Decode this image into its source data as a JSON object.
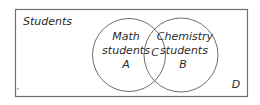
{
  "diagram": {
    "type": "venn",
    "universe": {
      "label": "Students",
      "region_label": "D"
    },
    "sets": [
      {
        "id": "A",
        "line1": "Math",
        "line2": "students",
        "region_label": "A"
      },
      {
        "id": "B",
        "line1": "Chemistry",
        "line2": "students",
        "region_label": "B"
      }
    ],
    "intersection": {
      "region_label": "C"
    },
    "colors": {
      "stroke": "#6e6e6e",
      "text": "#2a2a2a",
      "background": "#ffffff"
    }
  }
}
